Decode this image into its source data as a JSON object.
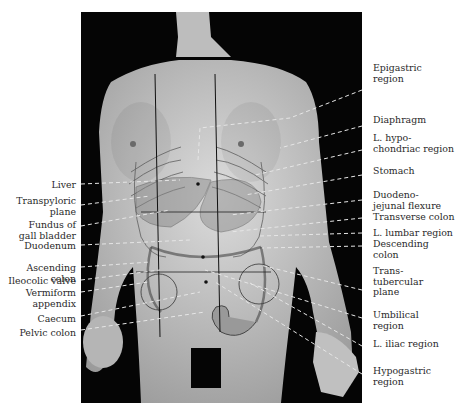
{
  "figure": {
    "left_labels": [
      {
        "id": "liver",
        "text": "Liver",
        "y": 180
      },
      {
        "id": "transpyloric-plane",
        "text": "Transpyloric\nplane",
        "y": 196
      },
      {
        "id": "fundus-gall-bladder",
        "text": "Fundus of\ngall bladder",
        "y": 220
      },
      {
        "id": "duodenum",
        "text": "Duodenum",
        "y": 241
      },
      {
        "id": "ascending-colon",
        "text": "Ascending colon",
        "y": 263
      },
      {
        "id": "ileocolic-valve",
        "text": "Ileocolic valve",
        "y": 276
      },
      {
        "id": "vermiform-appendix",
        "text": "Vermiform\nappendix",
        "y": 288
      },
      {
        "id": "caecum",
        "text": "Caecum",
        "y": 314
      },
      {
        "id": "pelvic-colon",
        "text": "Pelvic colon",
        "y": 328
      }
    ],
    "right_labels": [
      {
        "id": "epigastric-region",
        "text": "Epigastric\nregion",
        "y": 63
      },
      {
        "id": "diaphragm",
        "text": "Diaphragm",
        "y": 115
      },
      {
        "id": "l-hypochondriac-region",
        "text": "L. hypo-\nchondriac region",
        "y": 133
      },
      {
        "id": "stomach",
        "text": "Stomach",
        "y": 166
      },
      {
        "id": "duodenojejunal-flexure",
        "text": "Duodeno-\njejunal flexure",
        "y": 190
      },
      {
        "id": "transverse-colon",
        "text": "Transverse colon",
        "y": 212
      },
      {
        "id": "l-lumbar-region",
        "text": "L. lumbar region",
        "y": 228
      },
      {
        "id": "descending-colon",
        "text": "Descending\ncolon",
        "y": 239
      },
      {
        "id": "transtubercular-plane",
        "text": "Trans-\ntubercular\nplane",
        "y": 266
      },
      {
        "id": "umbilical-region",
        "text": "Umbilical\nregion",
        "y": 310
      },
      {
        "id": "l-iliac-region",
        "text": "L. iliac region",
        "y": 339
      },
      {
        "id": "hypogastric-region",
        "text": "Hypogastric\nregion",
        "y": 366
      }
    ],
    "colors": {
      "background": "#050505",
      "skin": "#c9c9c9",
      "leader": "#e8e8e8",
      "text": "#2a2a2a"
    }
  }
}
